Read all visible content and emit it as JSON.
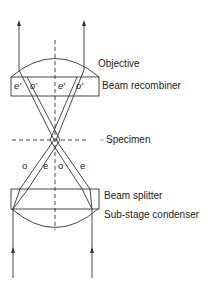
{
  "labels": {
    "objective": "Objective",
    "beam_recombiner": "Beam recombiner",
    "specimen": "Specimen",
    "beam_splitter": "Beam splitter",
    "condenser": "Sub-stage condenser"
  },
  "ray_labels_top": [
    "e'",
    "o'",
    "e'",
    "o'"
  ],
  "ray_labels_mid": [
    "o",
    "e",
    "o",
    "e"
  ],
  "colors": {
    "line": "#333333",
    "text": "#222222"
  }
}
